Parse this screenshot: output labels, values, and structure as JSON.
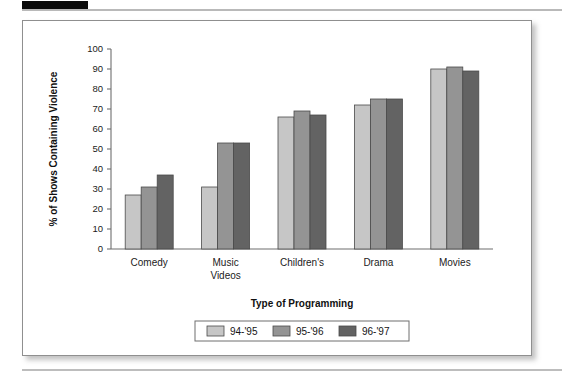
{
  "figure": {
    "frame_border_color": "#8f8f8f",
    "background": "#ffffff"
  },
  "chart_data": {
    "type": "bar",
    "title": "",
    "xlabel": "Type of Programming",
    "ylabel": "% of Shows Containing Violence",
    "categories": [
      "Comedy",
      "Music Videos",
      "Children's",
      "Drama",
      "Movies"
    ],
    "category_lines": [
      [
        "Comedy"
      ],
      [
        "Music",
        "Videos"
      ],
      [
        "Children's"
      ],
      [
        "Drama"
      ],
      [
        "Movies"
      ]
    ],
    "series": [
      {
        "name": "94-'95",
        "color": "#c6c6c6",
        "values": [
          27,
          31,
          66,
          72,
          90
        ]
      },
      {
        "name": "95-'96",
        "color": "#949494",
        "values": [
          31,
          53,
          69,
          75,
          91
        ]
      },
      {
        "name": "96-'97",
        "color": "#636363",
        "values": [
          37,
          53,
          67,
          75,
          89
        ]
      }
    ],
    "ylim": [
      0,
      100
    ],
    "yticks": [
      0,
      10,
      20,
      30,
      40,
      50,
      60,
      70,
      80,
      90,
      100
    ],
    "ytick_labels": [
      "0",
      "10",
      "20",
      "30",
      "40",
      "50",
      "60",
      "70",
      "80",
      "90",
      "100"
    ],
    "grid": false,
    "legend_position": "bottom",
    "legend_entries": [
      "94-'95",
      "95-'96",
      "96-'97"
    ]
  }
}
